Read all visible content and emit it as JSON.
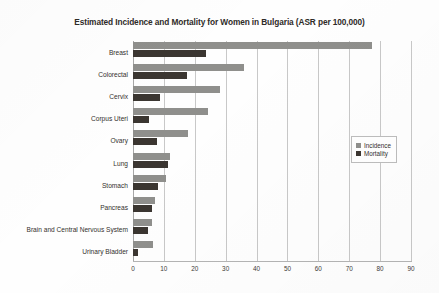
{
  "chart_data": {
    "type": "bar",
    "orientation": "horizontal",
    "title": "Estimated Incidence and Mortality for Women in Bulgaria (ASR per 100,000)",
    "xlabel": "",
    "ylabel": "",
    "xlim": [
      0,
      90
    ],
    "xticks": [
      0,
      10,
      20,
      30,
      40,
      50,
      60,
      70,
      80,
      90
    ],
    "xtick_labels": [
      "0",
      "10",
      "20",
      "30",
      "40",
      "50",
      "60",
      "70",
      "80",
      "90"
    ],
    "grid": "vertical",
    "legend_position": "center-right",
    "categories": [
      "Breast",
      "Colorectal",
      "Cervix",
      "Corpus Uteri",
      "Ovary",
      "Lung",
      "Stomach",
      "Pancreas",
      "Brain and Central Nervous System",
      "Urinary Bladder"
    ],
    "series": [
      {
        "name": "Incidence",
        "color": "#8f8f8c",
        "values": [
          77.5,
          36.0,
          28.1,
          24.3,
          17.8,
          12.0,
          10.6,
          7.2,
          6.3,
          6.5
        ]
      },
      {
        "name": "Mortality",
        "color": "#3b3631",
        "values": [
          23.6,
          17.5,
          8.7,
          5.2,
          7.7,
          11.3,
          8.2,
          6.2,
          4.9,
          1.5
        ]
      }
    ]
  },
  "legend": {
    "entries": [
      {
        "label": "Incidence",
        "color": "#8f8f8c"
      },
      {
        "label": "Mortality",
        "color": "#3b3631"
      }
    ]
  }
}
